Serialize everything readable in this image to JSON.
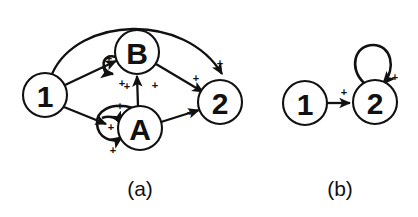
{
  "figure": {
    "background_color": "#ffffff",
    "stroke_color": "#111111",
    "panels": [
      {
        "id": "panel-a",
        "caption": "(a)",
        "caption_x": 140,
        "caption_y": 188,
        "nodes": [
          {
            "id": "a-node-1",
            "label": "1",
            "cx": 45,
            "cy": 95,
            "r": 22
          },
          {
            "id": "a-node-B",
            "label": "B",
            "cx": 137,
            "cy": 52,
            "r": 22
          },
          {
            "id": "a-node-A",
            "label": "A",
            "cx": 140,
            "cy": 128,
            "r": 22
          },
          {
            "id": "a-node-2",
            "label": "2",
            "cx": 220,
            "cy": 102,
            "r": 22
          }
        ],
        "edges": [
          {
            "id": "edge-1-to-2-arc",
            "from": "1",
            "to": "2",
            "sign": "+",
            "style": "arc-over-top"
          },
          {
            "id": "edge-1-to-B",
            "from": "1",
            "to": "B",
            "sign": "+",
            "style": "straight"
          },
          {
            "id": "edge-1-to-A",
            "from": "1",
            "to": "A",
            "sign": "+",
            "style": "straight"
          },
          {
            "id": "edge-A-to-B",
            "from": "A",
            "to": "B",
            "sign": "+",
            "style": "straight"
          },
          {
            "id": "edge-B-to-2",
            "from": "B",
            "to": "2",
            "sign": "+",
            "style": "straight"
          },
          {
            "id": "edge-A-to-2",
            "from": "A",
            "to": "2",
            "sign": "+",
            "style": "straight"
          },
          {
            "id": "edge-B-self-loop",
            "from": "B",
            "to": "B",
            "sign": "+",
            "style": "self-loop-left"
          },
          {
            "id": "edge-A-self-loop",
            "from": "A",
            "to": "A",
            "sign": "+",
            "style": "self-loop-left"
          }
        ],
        "signs": [
          {
            "id": "sign-a-1",
            "text": "+",
            "x": 109,
            "y": 58
          },
          {
            "id": "sign-a-2",
            "text": "+",
            "x": 122,
            "y": 83
          },
          {
            "id": "sign-a-3",
            "text": "+",
            "x": 155,
            "y": 85
          },
          {
            "id": "sign-a-4",
            "text": "+",
            "x": 127,
            "y": 86
          },
          {
            "id": "sign-a-5",
            "text": "+",
            "x": 120,
            "y": 106
          },
          {
            "id": "sign-a-6",
            "text": "+",
            "x": 111,
            "y": 127
          },
          {
            "id": "sign-a-7",
            "text": "+",
            "x": 113,
            "y": 150
          },
          {
            "id": "sign-a-8",
            "text": "+",
            "x": 196,
            "y": 78
          },
          {
            "id": "sign-a-9",
            "text": "+",
            "x": 190,
            "y": 112
          },
          {
            "id": "sign-a-10",
            "text": "+",
            "x": 220,
            "y": 63
          }
        ]
      },
      {
        "id": "panel-b",
        "caption": "(b)",
        "caption_x": 340,
        "caption_y": 188,
        "nodes": [
          {
            "id": "b-node-1",
            "label": "1",
            "cx": 305,
            "cy": 103,
            "r": 22
          },
          {
            "id": "b-node-2",
            "label": "2",
            "cx": 375,
            "cy": 102,
            "r": 22
          }
        ],
        "edges": [
          {
            "id": "edge-b-1-to-2",
            "from": "1",
            "to": "2",
            "sign": "+",
            "style": "straight"
          },
          {
            "id": "edge-b-2-self-loop",
            "from": "2",
            "to": "2",
            "sign": "+",
            "style": "self-loop-top"
          }
        ],
        "signs": [
          {
            "id": "sign-b-1",
            "text": "+",
            "x": 344,
            "y": 92
          },
          {
            "id": "sign-b-2",
            "text": "+",
            "x": 395,
            "y": 77
          }
        ]
      }
    ]
  }
}
